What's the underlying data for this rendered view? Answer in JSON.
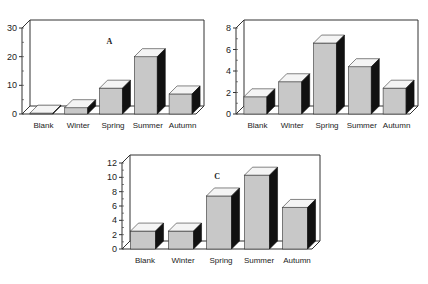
{
  "chart_data": [
    {
      "type": "bar",
      "panel": "A",
      "title": "A",
      "categories": [
        "Blank",
        "Winter",
        "Spring",
        "Summer",
        "Autumn"
      ],
      "values": [
        0.3,
        2.2,
        9,
        20,
        7
      ],
      "ylim": [
        0,
        30
      ],
      "yticks": [
        0,
        10,
        20,
        30
      ],
      "xlabel": "",
      "ylabel": "",
      "grid": false,
      "style": "3d"
    },
    {
      "type": "bar",
      "panel": "B",
      "title": "B",
      "categories": [
        "Blank",
        "Winter",
        "Spring",
        "Summer",
        "Autumn"
      ],
      "values": [
        1.6,
        3.0,
        6.6,
        4.4,
        2.4
      ],
      "ylim": [
        0,
        8
      ],
      "yticks": [
        0,
        2,
        4,
        6,
        8
      ],
      "xlabel": "",
      "ylabel": "",
      "grid": false,
      "style": "3d"
    },
    {
      "type": "bar",
      "panel": "C",
      "title": "C",
      "categories": [
        "Blank",
        "Winter",
        "Spring",
        "Summer",
        "Autumn"
      ],
      "values": [
        2.5,
        2.5,
        7.4,
        10.3,
        5.8
      ],
      "ylim": [
        0,
        12
      ],
      "yticks": [
        0,
        2,
        4,
        6,
        8,
        10,
        12
      ],
      "xlabel": "",
      "ylabel": "",
      "grid": false,
      "style": "3d"
    }
  ],
  "colors": {
    "bar_front": "#c8c8c8",
    "bar_top": "#f4f4f4",
    "bar_side": "#111111",
    "axis": "#333333"
  }
}
